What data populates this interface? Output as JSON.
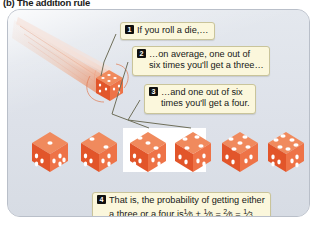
{
  "figure": {
    "caption": "(b) The addition rule",
    "panel_bg": "#dfe3ea",
    "panel_border": "#b9bfc9",
    "callout_bg": "#fbf7dc",
    "callout_border": "#c9c49a",
    "badge_bg": "#101010",
    "badge_fg": "#ffffff",
    "die_color": "#e8633a",
    "highlight_bg": "#ffffff"
  },
  "illustration": {
    "rolling_die_name": "rolling-die-with-motion-trail",
    "rolling_die_face": 5
  },
  "callouts": [
    {
      "number": "1",
      "lines": [
        "If you roll a die,…"
      ]
    },
    {
      "number": "2",
      "lines": [
        "…on average, one out of",
        "six times you'll get a three…"
      ]
    },
    {
      "number": "3",
      "lines": [
        "…and one out of six",
        "times you'll get a four."
      ]
    },
    {
      "number": "4",
      "lines": [
        "That is, the probability of getting either",
        "a three or a four is"
      ],
      "formula": {
        "terms": [
          {
            "num": "1",
            "den": "6"
          },
          {
            "op": "+"
          },
          {
            "num": "1",
            "den": "6"
          },
          {
            "op": "="
          },
          {
            "num": "2",
            "den": "6"
          },
          {
            "op": "="
          },
          {
            "num": "1",
            "den": "3"
          }
        ],
        "plain": "1/6 + 1/6 = 2/6 = 1/3."
      }
    }
  ],
  "dice_row": {
    "count": 6,
    "faces": [
      1,
      2,
      3,
      4,
      5,
      6
    ],
    "highlighted_indices": [
      2,
      3
    ],
    "labels": [
      "die-one",
      "die-two",
      "die-three",
      "die-four",
      "die-five",
      "die-six"
    ]
  }
}
